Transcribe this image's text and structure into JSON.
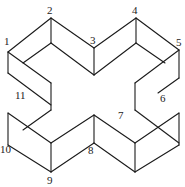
{
  "figure": {
    "stroke_color": "#1a1a1a",
    "background": "#ffffff",
    "labels": [
      {
        "id": "1",
        "text": "1",
        "x": 4,
        "y": 45
      },
      {
        "id": "2",
        "text": "2",
        "x": 47,
        "y": 14
      },
      {
        "id": "3",
        "text": "3",
        "x": 90,
        "y": 44
      },
      {
        "id": "4",
        "text": "4",
        "x": 132,
        "y": 14
      },
      {
        "id": "5",
        "text": "5",
        "x": 176,
        "y": 46
      },
      {
        "id": "6",
        "text": "6",
        "x": 160,
        "y": 102
      },
      {
        "id": "7",
        "text": "7",
        "x": 118,
        "y": 119
      },
      {
        "id": "8",
        "text": "8",
        "x": 88,
        "y": 154
      },
      {
        "id": "9",
        "text": "9",
        "x": 47,
        "y": 184
      },
      {
        "id": "10",
        "text": "10",
        "x": 0,
        "y": 153
      },
      {
        "id": "11",
        "text": "11",
        "x": 15,
        "y": 99
      }
    ],
    "edges": [
      [
        8,
        52,
        51,
        18
      ],
      [
        51,
        18,
        94,
        48
      ],
      [
        94,
        48,
        136,
        18
      ],
      [
        136,
        18,
        179,
        50
      ],
      [
        51,
        18,
        51,
        43
      ],
      [
        136,
        18,
        136,
        43
      ],
      [
        94,
        48,
        94,
        75
      ],
      [
        51,
        43,
        94,
        75
      ],
      [
        94,
        75,
        136,
        43
      ],
      [
        8,
        52,
        8,
        73
      ],
      [
        8,
        52,
        51,
        83
      ],
      [
        51,
        43,
        23,
        63
      ],
      [
        179,
        50,
        179,
        78
      ],
      [
        179,
        50,
        135,
        83
      ],
      [
        136,
        43,
        165,
        63
      ],
      [
        8,
        73,
        51,
        105
      ],
      [
        51,
        83,
        51,
        110
      ],
      [
        51,
        110,
        23,
        130
      ],
      [
        135,
        83,
        135,
        110
      ],
      [
        135,
        110,
        179,
        143
      ],
      [
        179,
        78,
        158,
        93
      ],
      [
        8,
        113,
        8,
        145
      ],
      [
        8,
        113,
        51,
        143
      ],
      [
        8,
        145,
        51,
        172
      ],
      [
        51,
        143,
        51,
        172
      ],
      [
        51,
        143,
        94,
        115
      ],
      [
        51,
        172,
        94,
        143
      ],
      [
        94,
        115,
        94,
        143
      ],
      [
        94,
        115,
        135,
        143
      ],
      [
        94,
        143,
        135,
        172
      ],
      [
        135,
        143,
        135,
        172
      ],
      [
        135,
        143,
        179,
        113
      ],
      [
        135,
        172,
        179,
        145
      ],
      [
        179,
        113,
        179,
        145
      ]
    ]
  }
}
